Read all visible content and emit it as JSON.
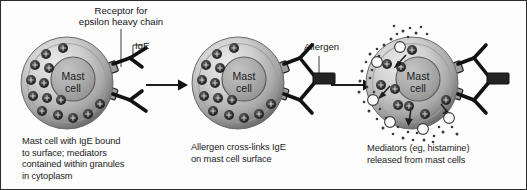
{
  "figure": {
    "background_color": "#fdfdfd",
    "border_color": "#2b2b2b",
    "ink_color": "#1a1a1a"
  },
  "colors": {
    "cell_membrane_dark": "#6f6f6f",
    "cell_membrane_light": "#e3e3e3",
    "cytoplasm_mid": "#b4b4b4",
    "nucleus_fill": "#a8a8a8",
    "nucleus_stroke": "#555555",
    "granule_fill": "#2e2e2e",
    "granule_highlight": "#cfcfcf",
    "receptor_fill": "#9a9a9a",
    "receptor_stroke": "#2a2a2a",
    "antibody_color": "#121212",
    "allergen_fill": "#242424",
    "mediator_dot": "#3a3a3a",
    "vesicle_fill": "#fbfbfb",
    "arrow_color": "#111111",
    "leader_color": "#6a6a6a"
  },
  "panels": [
    {
      "id": "panel-1",
      "cell_label_line_1": "Mast",
      "cell_label_line_2": "cell",
      "granule_count": 14,
      "receptor_count": 2,
      "antibody_count": 2,
      "caption": "Mast cell with IgE bound\nto surface; mediators\ncontained within granules\nin cytoplasm",
      "callouts": [
        {
          "name": "receptor-label",
          "text": "Receptor for\nepsilon heavy chain"
        },
        {
          "name": "ige-label",
          "text": "IgE"
        }
      ]
    },
    {
      "id": "panel-2",
      "cell_label_line_1": "Mast",
      "cell_label_line_2": "cell",
      "granule_count": 14,
      "receptor_count": 2,
      "antibody_count": 2,
      "caption": "Allergen cross-links IgE\non mast cell surface",
      "callouts": [
        {
          "name": "allergen-label",
          "text": "Allergen"
        }
      ]
    },
    {
      "id": "panel-3",
      "cell_label_line_1": "Mast",
      "cell_label_line_2": "cell",
      "granule_count": 9,
      "receptor_count": 2,
      "antibody_count": 2,
      "vesicle_count": 6,
      "migration_arrow_count": 4,
      "caption": "Mediators (eg, histamine)\nreleased from mast cells",
      "callouts": []
    }
  ],
  "flow": {
    "arrow_1_name": "process-arrow-1",
    "arrow_2_name": "process-arrow-2",
    "direction": "left-to-right",
    "steps": 3
  }
}
